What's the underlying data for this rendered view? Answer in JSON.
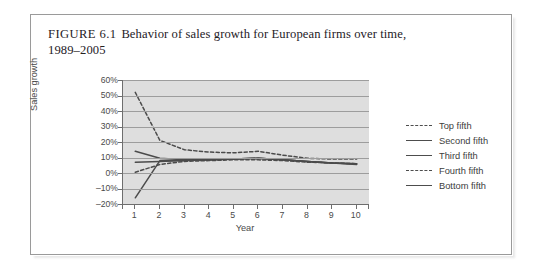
{
  "figure": {
    "number": "FIGURE 6.1",
    "caption": "Behavior of sales growth for European firms over time,",
    "caption_line2": "1989–2005"
  },
  "chart_data": {
    "type": "line",
    "title": "Behavior of sales growth for European firms over time, 1989–2005",
    "xlabel": "Year",
    "ylabel": "Sales growth",
    "x": [
      1,
      2,
      3,
      4,
      5,
      6,
      7,
      8,
      9,
      10
    ],
    "xlim": [
      0.5,
      10.5
    ],
    "ylim": [
      -20,
      60
    ],
    "ytick_labels": [
      "60%",
      "50%",
      "40%",
      "30%",
      "20%",
      "10%",
      "0%",
      "–10%",
      "–20%"
    ],
    "ytick_values": [
      60,
      50,
      40,
      30,
      20,
      10,
      0,
      -10,
      -20
    ],
    "xtick_labels": [
      "1",
      "2",
      "3",
      "4",
      "5",
      "6",
      "7",
      "8",
      "9",
      "10"
    ],
    "grid": true,
    "legend_position": "right",
    "series": [
      {
        "name": "Top fifth",
        "style": "dashed",
        "values": [
          52,
          21,
          15,
          13.5,
          13,
          14,
          11.5,
          9.5,
          9,
          9
        ]
      },
      {
        "name": "Second fifth",
        "style": "solid",
        "values": [
          14,
          9.5,
          8.5,
          8.5,
          9,
          9.5,
          8.5,
          7.5,
          6.5,
          6
        ]
      },
      {
        "name": "Third fifth",
        "style": "solid",
        "values": [
          7,
          7.5,
          8,
          8.5,
          9,
          9.5,
          8.5,
          7.5,
          6.5,
          6
        ]
      },
      {
        "name": "Fourth fifth",
        "style": "dashed",
        "values": [
          0.5,
          5.5,
          7.5,
          8,
          8.5,
          8.5,
          8,
          7,
          6.5,
          6
        ]
      },
      {
        "name": "Bottom fifth",
        "style": "solid",
        "values": [
          -16,
          8,
          8,
          8.5,
          9,
          9.5,
          8.5,
          7.5,
          6.5,
          5.5
        ]
      }
    ]
  },
  "legend": {
    "items": [
      {
        "label": "Top fifth"
      },
      {
        "label": "Second fifth"
      },
      {
        "label": "Third fifth"
      },
      {
        "label": "Fourth fifth"
      },
      {
        "label": "Bottom fifth"
      }
    ]
  },
  "colors": {
    "plot_background": "#dedede",
    "gridline": "#9d9d9d",
    "series_line": "#4b4b4b",
    "axis": "#6e6e6e",
    "frame_border": "#9a9a9a",
    "page_background": "#ffffff"
  }
}
